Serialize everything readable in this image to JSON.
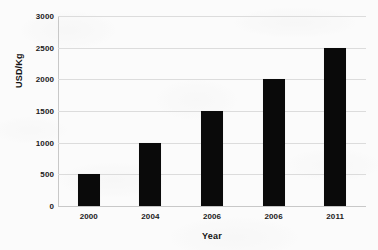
{
  "chart_data": {
    "type": "bar",
    "title": "",
    "subtitle": "",
    "xlabel": "Year",
    "ylabel": "USD/Kg",
    "categories": [
      "2000",
      "2004",
      "2006",
      "2006",
      "2011"
    ],
    "values": [
      500,
      1000,
      1500,
      2000,
      2500
    ],
    "series": [
      {
        "name": "USD/Kg",
        "values": [
          500,
          1000,
          1500,
          2000,
          2500
        ],
        "color": "#0a0a0a"
      }
    ],
    "ylim": [
      0,
      3000
    ],
    "y_ticks": [
      0,
      500,
      1000,
      1500,
      2000,
      2500,
      3000
    ],
    "y_tick_labels": [
      "0",
      "500",
      "1000",
      "1500",
      "2000",
      "2500",
      "3000"
    ],
    "x_tick_labels": [
      "2000",
      "2004",
      "2006",
      "2006",
      "2011"
    ],
    "grid": true,
    "grid_axis": "y",
    "grid_color": "#dcdcdc",
    "legend": false,
    "legend_position": "none",
    "annotations": [],
    "bar_color": "#0a0a0a",
    "background_color": "#fbfbfb",
    "axis_color": "#c8c8c8",
    "text_color": "#1a1a1a"
  }
}
